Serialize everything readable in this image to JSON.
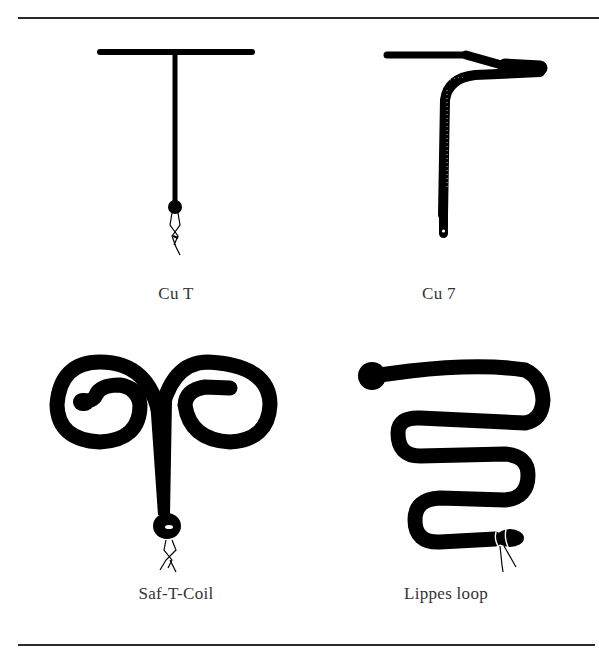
{
  "figures": [
    {
      "id": "cu-t",
      "label": "Cu T"
    },
    {
      "id": "cu-7",
      "label": "Cu 7"
    },
    {
      "id": "saf-t-coil",
      "label": "Saf-T-Coil"
    },
    {
      "id": "lippes-loop",
      "label": "Lippes loop"
    }
  ],
  "colors": {
    "ink": "#000000",
    "rule": "#2a2a2a",
    "text": "#333333",
    "background": "#ffffff"
  }
}
